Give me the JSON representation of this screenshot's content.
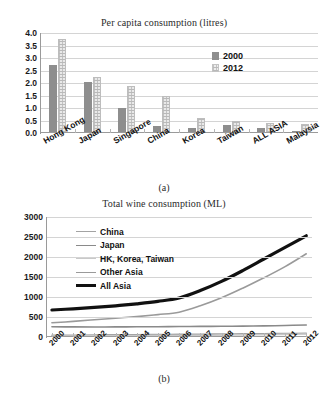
{
  "figure": {
    "panel_a_caption": "(a)",
    "panel_b_caption": "(b)"
  },
  "chart_data": [
    {
      "type": "bar",
      "title": "Per capita consumption (litres)",
      "xlabel": "",
      "ylabel": "",
      "ylim": [
        0,
        4.0
      ],
      "yticks": [
        "0.0",
        "0.5",
        "1.0",
        "1.5",
        "2.0",
        "2.5",
        "3.0",
        "3.5",
        "4.0"
      ],
      "grid": true,
      "legend_position": "upper-right",
      "categories": [
        "Hong Kong",
        "Japan",
        "Singapore",
        "China",
        "Korea",
        "Taiwan",
        "ALL ASIA",
        "Malaysia"
      ],
      "series": [
        {
          "name": "2000",
          "color": "#8e8e8e",
          "values": [
            2.72,
            2.05,
            1.0,
            0.3,
            0.2,
            0.33,
            0.2,
            0.08
          ]
        },
        {
          "name": "2012",
          "color": "#ededed",
          "values": [
            3.75,
            2.25,
            1.9,
            1.5,
            0.6,
            0.5,
            0.4,
            0.35
          ]
        }
      ]
    },
    {
      "type": "line",
      "title": "Total wine consumption (ML)",
      "xlabel": "",
      "ylabel": "",
      "ylim": [
        0,
        3000
      ],
      "yticks": [
        "0",
        "500",
        "1000",
        "1500",
        "2000",
        "2500",
        "3000"
      ],
      "grid": true,
      "legend_position": "upper-left",
      "x": [
        "2000",
        "2001",
        "2002",
        "2003",
        "2004",
        "2005",
        "2006",
        "2007",
        "2008",
        "2009",
        "2010",
        "2011",
        "2012"
      ],
      "series": [
        {
          "name": "China",
          "color": "#a3a3a3",
          "width": 1.6,
          "values": [
            40,
            45,
            50,
            55,
            58,
            62,
            66,
            70,
            74,
            78,
            82,
            86,
            90
          ]
        },
        {
          "name": "Japan",
          "color": "#8a8a8a",
          "width": 1.6,
          "values": [
            255,
            252,
            250,
            252,
            255,
            258,
            262,
            265,
            268,
            272,
            278,
            288,
            300
          ]
        },
        {
          "name": "HK, Korea, Taiwan",
          "color": "#c9c9c9",
          "width": 1.6,
          "values": [
            25,
            26,
            28,
            30,
            32,
            35,
            38,
            42,
            47,
            52,
            58,
            66,
            75
          ]
        },
        {
          "name": "Other Asia",
          "color": "#9a9a9a",
          "width": 1.6,
          "values": [
            355,
            390,
            430,
            470,
            510,
            560,
            620,
            780,
            980,
            1220,
            1480,
            1760,
            2080
          ]
        },
        {
          "name": "All Asia",
          "color": "#111111",
          "width": 3.2,
          "values": [
            675,
            705,
            740,
            780,
            830,
            890,
            975,
            1160,
            1390,
            1660,
            1950,
            2240,
            2530
          ]
        }
      ]
    }
  ]
}
